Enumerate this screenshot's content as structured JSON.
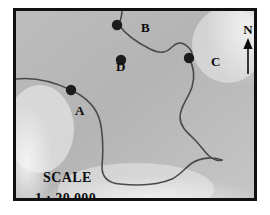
{
  "figure": {
    "name": "topographic-sketch-map",
    "border_color": "#111111",
    "land_fill": "#b9b9b9",
    "highlight_fill": "#eeeeee",
    "line_color": "#4a4a4a",
    "marker_color": "#1c1c1c",
    "text_color": "#0b0b0b"
  },
  "points": [
    {
      "id": "a",
      "label": "A",
      "x": 68,
      "y": 87
    },
    {
      "id": "b",
      "label": "B",
      "x": 114,
      "y": 22
    },
    {
      "id": "c",
      "label": "C",
      "x": 186,
      "y": 55
    },
    {
      "id": "d",
      "label": "D",
      "x": 118,
      "y": 57
    }
  ],
  "compass": {
    "label": "N",
    "icon": "north-arrow-icon"
  },
  "scale": {
    "title": "SCALE",
    "ratio": "1 : 20 000"
  }
}
